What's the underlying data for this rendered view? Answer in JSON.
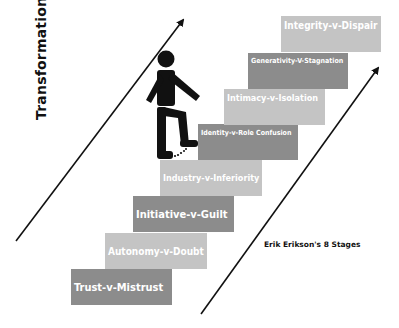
{
  "diagram": {
    "axis_label": "Transformation",
    "caption": "Erik Erikson's 8 Stages",
    "colors": {
      "light_step": "#c4c4c4",
      "dark_step": "#8c8c8c",
      "text": "#ffffff",
      "ink": "#111111"
    },
    "stages": [
      {
        "order": 1,
        "label": "Trust-v-Mistrust"
      },
      {
        "order": 2,
        "label": "Autonomy-v-Doubt"
      },
      {
        "order": 3,
        "label": "Initiative-v-Guilt"
      },
      {
        "order": 4,
        "label": "Industry-v-Inferiority"
      },
      {
        "order": 5,
        "label": "Identity-v-Role Confusion"
      },
      {
        "order": 6,
        "label": "Intimacy-v-Isolation"
      },
      {
        "order": 7,
        "label": "Generativity-V-Stagnation"
      },
      {
        "order": 8,
        "label": "Integrity-v-Dispair"
      }
    ],
    "figure": "person-climbing-stairs-icon"
  }
}
